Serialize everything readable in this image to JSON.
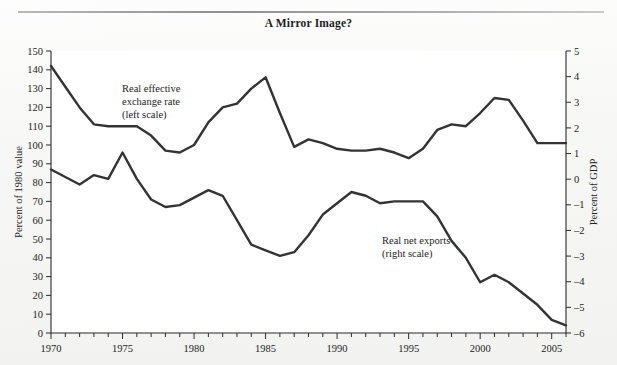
{
  "figure": {
    "title": "A Mirror Image?",
    "background_color": "#f5f5f3",
    "plot_background_color": "#ffffff",
    "line_color": "#333333",
    "axis_color": "#2b2b2b"
  },
  "annotations": {
    "left_series": {
      "line1": "Real effective",
      "line2": "exchange rate",
      "line3": "(left scale)"
    },
    "right_series": {
      "line1": "Real net exports",
      "line2": "(right scale)"
    }
  },
  "chart_data": {
    "type": "line",
    "title": "A Mirror Image?",
    "xlabel": "",
    "ylabel": "Percent of 1980 value",
    "y2label": "Percent of GDP",
    "xlim": [
      1970,
      2006
    ],
    "ylim": [
      0,
      150
    ],
    "y2lim": [
      -6,
      5
    ],
    "grid": false,
    "legend": "inline-annotations",
    "xticks": [
      1970,
      1975,
      1980,
      1985,
      1990,
      1995,
      2000,
      2005
    ],
    "xtick_labels": [
      "1970",
      "1975",
      "1980",
      "1985",
      "1990",
      "1995",
      "2000",
      "2005"
    ],
    "xticks_minor_step": 1,
    "yticks": [
      0,
      10,
      20,
      30,
      40,
      50,
      60,
      70,
      80,
      90,
      100,
      110,
      120,
      130,
      140,
      150
    ],
    "ytick_labels": [
      "0",
      "10",
      "20",
      "30",
      "40",
      "50",
      "60",
      "70",
      "80",
      "90",
      "100",
      "110",
      "120",
      "130",
      "140",
      "150"
    ],
    "y2ticks": [
      -6,
      -5,
      -4,
      -3,
      -2,
      -1,
      0,
      1,
      2,
      3,
      4,
      5
    ],
    "y2tick_labels": [
      "–6",
      "–5",
      "–4",
      "–3",
      "–2",
      "–1",
      "0",
      "1",
      "2",
      "3",
      "4",
      "5"
    ],
    "x": [
      1970,
      1971,
      1972,
      1973,
      1974,
      1975,
      1976,
      1977,
      1978,
      1979,
      1980,
      1981,
      1982,
      1983,
      1984,
      1985,
      1986,
      1987,
      1988,
      1989,
      1990,
      1991,
      1992,
      1993,
      1994,
      1995,
      1996,
      1997,
      1998,
      1999,
      2000,
      2001,
      2002,
      2003,
      2004,
      2005,
      2006
    ],
    "series": [
      {
        "name": "Real effective exchange rate (left scale)",
        "axis": "left",
        "units": "Percent of 1980 value",
        "values": [
          142,
          131,
          120,
          111,
          110,
          110,
          110,
          105,
          97,
          96,
          100,
          112,
          120,
          122,
          130,
          136,
          117,
          99,
          103,
          101,
          98,
          97,
          97,
          98,
          96,
          93,
          98,
          108,
          111,
          110,
          117,
          125,
          124,
          113,
          101,
          101,
          101
        ]
      },
      {
        "name": "Real net exports (right scale)",
        "axis": "right",
        "units": "Percent of GDP",
        "values_left_scale": [
          87,
          83,
          79,
          84,
          82,
          96,
          82,
          71,
          67,
          68,
          72,
          76,
          73,
          60,
          47,
          44,
          41,
          43,
          52,
          63,
          69,
          75,
          73,
          69,
          70,
          70,
          70,
          62,
          49,
          40,
          27,
          31,
          27,
          21,
          15,
          7,
          4
        ],
        "values": [
          -1.6,
          -1.9,
          -2.2,
          -1.8,
          -2.0,
          -0.9,
          -2.0,
          -2.8,
          -3.1,
          -3.0,
          -2.7,
          -2.4,
          -2.6,
          -3.6,
          -4.5,
          -4.7,
          -5.0,
          -4.8,
          -4.2,
          -3.4,
          -3.0,
          -2.5,
          -2.7,
          -3.0,
          -2.9,
          -2.9,
          -2.9,
          -3.5,
          -4.4,
          -5.1,
          -5.8,
          -5.5,
          -5.8,
          -6.3,
          -6.7,
          -7.4,
          -7.6
        ]
      }
    ]
  }
}
